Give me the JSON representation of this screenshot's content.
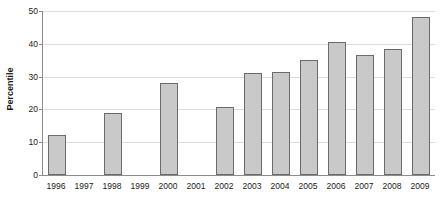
{
  "chart_data": {
    "type": "bar",
    "title": "",
    "xlabel": "",
    "ylabel": "Percentile",
    "categories": [
      "1996",
      "1997",
      "1998",
      "1999",
      "2000",
      "2001",
      "2002",
      "2003",
      "2004",
      "2005",
      "2006",
      "2007",
      "2008",
      "2009"
    ],
    "values": [
      12.3,
      null,
      19.0,
      null,
      28.2,
      null,
      20.6,
      31.0,
      31.5,
      35.2,
      40.5,
      36.6,
      38.4,
      48.2
    ],
    "series": [
      {
        "name": "Percentile",
        "values": [
          12.3,
          null,
          19.0,
          null,
          28.2,
          null,
          20.6,
          31.0,
          31.5,
          35.2,
          40.5,
          36.6,
          38.4,
          48.2
        ]
      }
    ],
    "ylim": [
      0,
      50
    ],
    "yticks": [
      0,
      10,
      20,
      30,
      40,
      50
    ],
    "ytick_labels": [
      "0",
      "10",
      "20",
      "30",
      "40",
      "50"
    ],
    "grid": true,
    "grid_axis": "y",
    "legend": false,
    "legend_position": "none",
    "bar_fill_color": "#c9c9c9",
    "bar_border_color": "#6b6b6b",
    "gridline_color": "#dcdcdc",
    "axis_color": "#8c8c8c",
    "text_color": "#1a1a1a",
    "missing_categories": [
      "1997",
      "1999",
      "2001"
    ]
  }
}
